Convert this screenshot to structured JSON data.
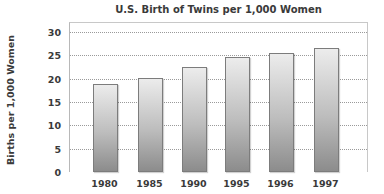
{
  "chart_data": {
    "type": "bar",
    "title": "U.S. Birth of Twins per 1,000 Women",
    "xlabel": "",
    "ylabel": "Births per 1,000 Women",
    "categories": [
      "1980",
      "1985",
      "1990",
      "1995",
      "1996",
      "1997"
    ],
    "values": [
      18.8,
      20.1,
      22.4,
      24.7,
      25.5,
      26.6
    ],
    "ylim": [
      0,
      30
    ],
    "yticks": [
      "0",
      "5",
      "10",
      "15",
      "20",
      "25",
      "30"
    ],
    "grid": true,
    "legend": null,
    "colors": {
      "bar_top": "#ececec",
      "bar_bottom": "#8c8c8c",
      "bar_border": "#7c7c7c",
      "gridline": "#9a9a9a"
    }
  }
}
